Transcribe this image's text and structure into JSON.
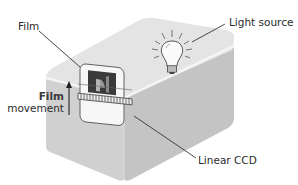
{
  "diagram": {
    "labels": {
      "film": "Film",
      "light_source": "Light source",
      "film_movement_line1": "Film",
      "film_movement_line2": "movement",
      "linear_ccd": "Linear CCD"
    },
    "colors": {
      "box_top": "#e2e2e2",
      "box_front": "#cfcfcf",
      "box_side": "#bfbfbf",
      "edge_highlight": "#f2f2f2",
      "leader_line": "#333333",
      "text": "#2a2a2a"
    },
    "components": [
      {
        "name": "scanner-box",
        "description": "Rounded rectangular housing"
      },
      {
        "name": "light-bulb",
        "description": "Light source with rays on top of housing"
      },
      {
        "name": "film-holder",
        "description": "Slide/film frame with photo image in slot"
      },
      {
        "name": "linear-ccd",
        "description": "Striped linear sensor strip across film holder"
      },
      {
        "name": "film-movement-arrow",
        "description": "Upward arrow indicating film movement"
      }
    ]
  }
}
